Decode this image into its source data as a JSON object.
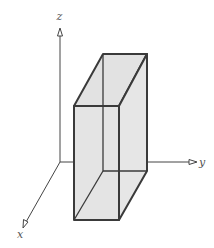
{
  "diagram": {
    "type": "3d-rectangular-box-on-axes",
    "axes": {
      "x_label": "x",
      "y_label": "y",
      "z_label": "z"
    },
    "colors": {
      "box_fill": "#e4e4e4",
      "box_edge": "#3a3a3a",
      "axis": "#444444",
      "background": "#ffffff"
    }
  }
}
